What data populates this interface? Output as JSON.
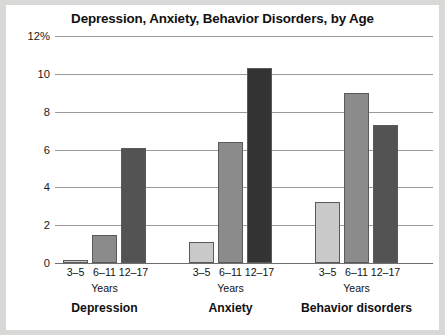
{
  "chart_data": {
    "type": "bar",
    "title": "Depression, Anxiety, Behavior Disorders, by Age",
    "xlabel": "Years",
    "ylabel": "",
    "ylim": [
      0,
      12
    ],
    "grid": true,
    "legend": "none",
    "yticks": [
      {
        "value": 12,
        "label": "12%"
      },
      {
        "value": 10,
        "label": "10"
      },
      {
        "value": 8,
        "label": "8"
      },
      {
        "value": 6,
        "label": "6"
      },
      {
        "value": 4,
        "label": "4"
      },
      {
        "value": 2,
        "label": "2"
      },
      {
        "value": 0,
        "label": "0"
      }
    ],
    "categories": [
      "3–5",
      "6–11",
      "12–17"
    ],
    "groups": [
      {
        "name": "Depression",
        "axis_caption": "Years",
        "bars": [
          {
            "category": "3–5",
            "value": 0.15,
            "color": "#c9c9c9"
          },
          {
            "category": "6–11",
            "value": 1.5,
            "color": "#8b8b8b"
          },
          {
            "category": "12–17",
            "value": 6.1,
            "color": "#535353"
          }
        ]
      },
      {
        "name": "Anxiety",
        "axis_caption": "Years",
        "bars": [
          {
            "category": "3–5",
            "value": 1.1,
            "color": "#c9c9c9"
          },
          {
            "category": "6–11",
            "value": 6.4,
            "color": "#8b8b8b"
          },
          {
            "category": "12–17",
            "value": 10.3,
            "color": "#333333"
          }
        ]
      },
      {
        "name": "Behavior disorders",
        "axis_caption": "Years",
        "bars": [
          {
            "category": "3–5",
            "value": 3.2,
            "color": "#c9c9c9"
          },
          {
            "category": "6–11",
            "value": 9.0,
            "color": "#8b8b8b"
          },
          {
            "category": "12–17",
            "value": 7.3,
            "color": "#535353"
          }
        ]
      }
    ],
    "series": [
      {
        "name": "3–5",
        "values": [
          0.15,
          1.1,
          3.2
        ]
      },
      {
        "name": "6–11",
        "values": [
          1.5,
          6.4,
          9.0
        ]
      },
      {
        "name": "12–17",
        "values": [
          6.1,
          10.3,
          7.3
        ]
      }
    ],
    "colors": {
      "age_3_5": "#c9c9c9",
      "age_6_11": "#8b8b8b",
      "age_12_17": "#535353",
      "gridline": "#9a9a9a",
      "plot_background": "#ffffff",
      "page_background": "#d8d8d6",
      "text": "#111111"
    }
  }
}
